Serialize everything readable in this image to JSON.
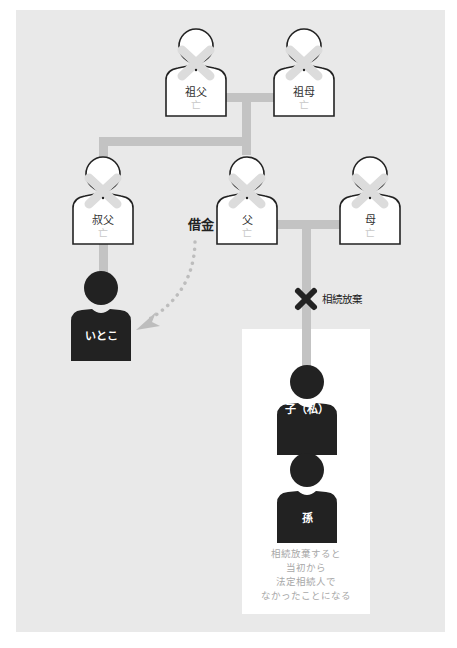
{
  "diagram": {
    "people": {
      "grandfather": {
        "name": "祖父",
        "status": "亡"
      },
      "grandmother": {
        "name": "祖母",
        "status": "亡"
      },
      "uncle": {
        "name": "叔父",
        "status": "亡"
      },
      "father": {
        "name": "父",
        "status": "亡"
      },
      "mother": {
        "name": "母",
        "status": "亡"
      },
      "cousin": {
        "name": "いとこ"
      },
      "child": {
        "name": "子（私）"
      },
      "grandchild": {
        "name": "孫"
      }
    },
    "debt_label": "借金",
    "renounce_label": "相続放棄",
    "note_lines": [
      "相続放棄すると",
      "当初から",
      "法定相続人で",
      "なかったことになる"
    ],
    "colors": {
      "panel": "#e9e9e9",
      "line": "#c3c3c3",
      "deceased_fill": "#ffffff",
      "living_fill": "#222222",
      "cross_mark": "#222222",
      "debt_arrow": "#bdbdbd"
    }
  }
}
